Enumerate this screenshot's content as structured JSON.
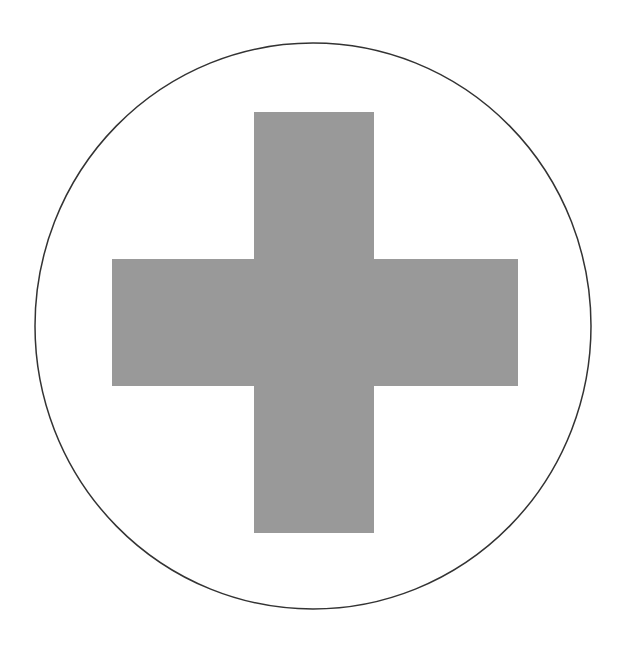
{
  "figure": {
    "title": "",
    "shape": "cross-in-circle",
    "colors": {
      "background": "#ffffff",
      "circle_stroke": "#333333",
      "cross_fill": "#999999"
    },
    "circle": {
      "cx": 313,
      "cy": 326,
      "rx": 278,
      "ry": 283
    },
    "cross": {
      "vertical_bar": {
        "x": 254,
        "y": 112,
        "width": 120,
        "height": 421
      },
      "horizontal_bar": {
        "x": 112,
        "y": 259,
        "width": 406,
        "height": 127
      }
    }
  }
}
